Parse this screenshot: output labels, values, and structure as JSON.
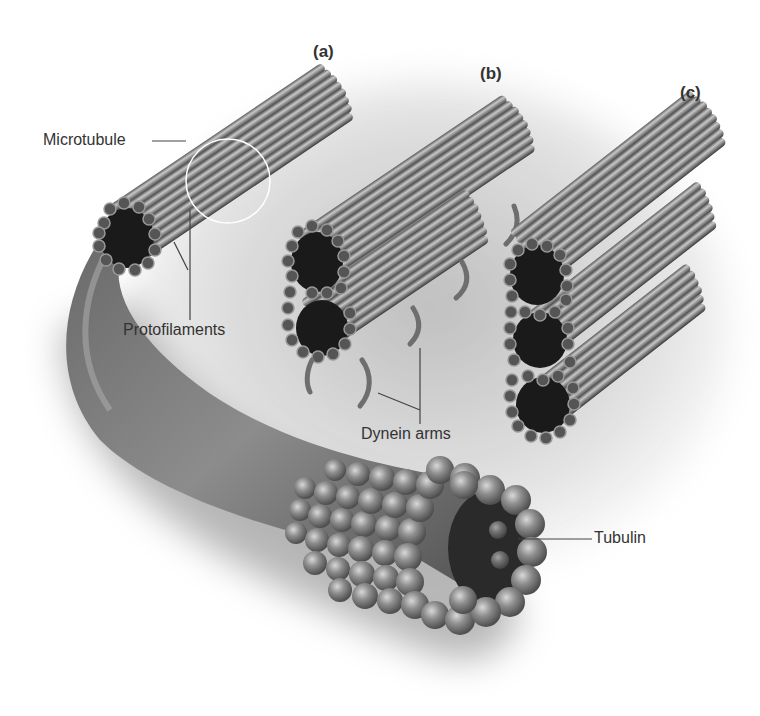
{
  "figure": {
    "panels": [
      {
        "id": "a",
        "label": "(a)"
      },
      {
        "id": "b",
        "label": "(b)"
      },
      {
        "id": "c",
        "label": "(c)"
      }
    ],
    "labels": {
      "microtubule": "Microtubule",
      "protofilaments": "Protofilaments",
      "dynein_arms": "Dynein arms",
      "tubulin": "Tubulin"
    },
    "colors": {
      "background": "#ffffff",
      "shadow": "#c8c8c8",
      "tube": "#8a8a8a",
      "tube_highlight": "#c4c4c4",
      "tube_dark": "#3a3a3a",
      "lumen": "#1a1a1a",
      "leader_line": "#444444"
    }
  }
}
